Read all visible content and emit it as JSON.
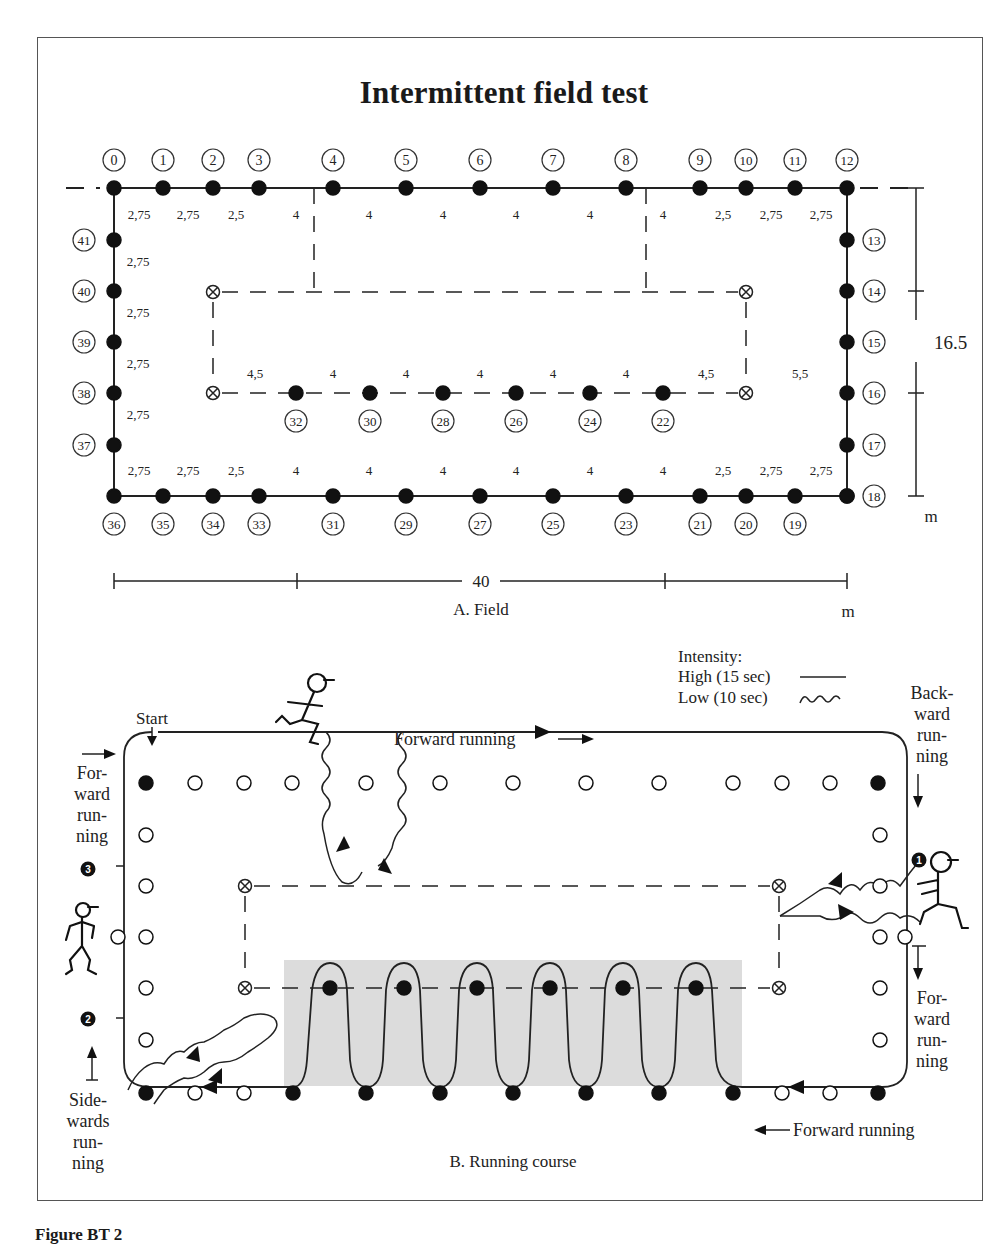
{
  "title": "Intermittent field test",
  "caption": "Figure BT 2",
  "field": {
    "caption": "A. Field",
    "width_label": "40",
    "height_label": "16.5",
    "unit_bottom": "m",
    "unit_right": "m",
    "top_points": [
      {
        "id": "0",
        "x": 114
      },
      {
        "id": "1",
        "x": 163
      },
      {
        "id": "2",
        "x": 213
      },
      {
        "id": "3",
        "x": 259
      },
      {
        "id": "4",
        "x": 333
      },
      {
        "id": "5",
        "x": 406
      },
      {
        "id": "6",
        "x": 480
      },
      {
        "id": "7",
        "x": 553
      },
      {
        "id": "8",
        "x": 626
      },
      {
        "id": "9",
        "x": 700
      },
      {
        "id": "10",
        "x": 746
      },
      {
        "id": "11",
        "x": 795
      },
      {
        "id": "12",
        "x": 847
      }
    ],
    "top_distances": [
      {
        "v": "2,75",
        "x": 139
      },
      {
        "v": "2,75",
        "x": 188
      },
      {
        "v": "2,5",
        "x": 236
      },
      {
        "v": "4",
        "x": 296
      },
      {
        "v": "4",
        "x": 369
      },
      {
        "v": "4",
        "x": 443
      },
      {
        "v": "4",
        "x": 516
      },
      {
        "v": "4",
        "x": 590
      },
      {
        "v": "4",
        "x": 663
      },
      {
        "v": "2,5",
        "x": 723
      },
      {
        "v": "2,75",
        "x": 771
      },
      {
        "v": "2,75",
        "x": 821
      }
    ],
    "right_points": [
      {
        "id": "13",
        "y": 240
      },
      {
        "id": "14",
        "y": 291
      },
      {
        "id": "15",
        "y": 342
      },
      {
        "id": "16",
        "y": 393
      },
      {
        "id": "17",
        "y": 445
      },
      {
        "id": "18",
        "y": 496
      }
    ],
    "bottom_points": [
      {
        "id": "36",
        "x": 114
      },
      {
        "id": "35",
        "x": 163
      },
      {
        "id": "34",
        "x": 213
      },
      {
        "id": "33",
        "x": 259
      },
      {
        "id": "31",
        "x": 333
      },
      {
        "id": "29",
        "x": 406
      },
      {
        "id": "27",
        "x": 480
      },
      {
        "id": "25",
        "x": 553
      },
      {
        "id": "23",
        "x": 626
      },
      {
        "id": "21",
        "x": 700
      },
      {
        "id": "20",
        "x": 746
      },
      {
        "id": "19",
        "x": 795
      }
    ],
    "bottom_distances": [
      {
        "v": "2,75",
        "x": 139
      },
      {
        "v": "2,75",
        "x": 188
      },
      {
        "v": "2,5",
        "x": 236
      },
      {
        "v": "4",
        "x": 296
      },
      {
        "v": "4",
        "x": 369
      },
      {
        "v": "4",
        "x": 443
      },
      {
        "v": "4",
        "x": 516
      },
      {
        "v": "4",
        "x": 590
      },
      {
        "v": "4",
        "x": 663
      },
      {
        "v": "2,5",
        "x": 723
      },
      {
        "v": "2,75",
        "x": 771
      },
      {
        "v": "2,75",
        "x": 821
      }
    ],
    "left_points": [
      {
        "id": "41",
        "y": 240
      },
      {
        "id": "40",
        "y": 291
      },
      {
        "id": "39",
        "y": 342
      },
      {
        "id": "38",
        "y": 393
      },
      {
        "id": "37",
        "y": 445
      }
    ],
    "left_distances": [
      {
        "v": "2,75",
        "y": 266
      },
      {
        "v": "2,75",
        "y": 317
      },
      {
        "v": "2,75",
        "y": 368
      },
      {
        "v": "2,75",
        "y": 419
      }
    ],
    "middle_points": [
      {
        "id": "32",
        "x": 296
      },
      {
        "id": "30",
        "x": 370
      },
      {
        "id": "28",
        "x": 443
      },
      {
        "id": "26",
        "x": 516
      },
      {
        "id": "24",
        "x": 590
      },
      {
        "id": "22",
        "x": 663
      }
    ],
    "middle_distances": [
      {
        "v": "4,5",
        "x": 255
      },
      {
        "v": "4",
        "x": 333
      },
      {
        "v": "4",
        "x": 406
      },
      {
        "v": "4",
        "x": 480
      },
      {
        "v": "4",
        "x": 553
      },
      {
        "v": "4",
        "x": 626
      },
      {
        "v": "4,5",
        "x": 706
      }
    ],
    "side_distance": {
      "v": "5,5",
      "x": 800,
      "y": 378
    }
  },
  "course": {
    "caption": "B. Running course",
    "start_label": "Start",
    "legend": {
      "heading": "Intensity:",
      "high": "High (15 sec)",
      "low": "Low (10 sec)"
    },
    "labels": {
      "forward_top": "Forward running",
      "forward_bottom": "Forward running",
      "forward_left": [
        "For-",
        "ward",
        "run-",
        "ning"
      ],
      "backward_right": [
        "Back-",
        "ward",
        "run-",
        "ning"
      ],
      "forward_right": [
        "For-",
        "ward",
        "run-",
        "ning"
      ],
      "sidewards_left": [
        "Side-",
        "wards",
        "run-",
        "ning"
      ]
    },
    "step_markers": [
      "1",
      "2",
      "3"
    ]
  }
}
